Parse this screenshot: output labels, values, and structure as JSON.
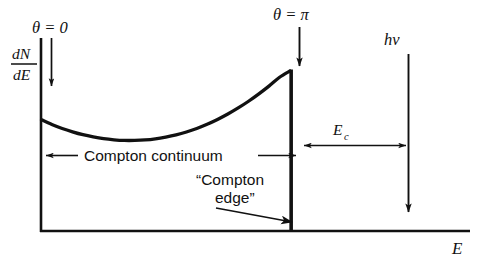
{
  "figure": {
    "kind": "compton-scattering-energy-spectrum",
    "axis": {
      "x_label": "E",
      "y_label_numerator": "dN",
      "y_label_denominator": "dE",
      "y_label_full": "dN/dE"
    },
    "annotations": {
      "theta_zero": "θ = 0",
      "theta_pi": "θ = π",
      "photon_energy": "hν",
      "compton_edge_energy": "E",
      "compton_edge_energy_subscript": "c",
      "continuum_label": "Compton continuum",
      "edge_label_line1": "“Compton",
      "edge_label_line2": "edge”"
    },
    "colors": {
      "ink": "#111111",
      "background": "#ffffff"
    }
  },
  "chart_data": {
    "type": "line",
    "title": "",
    "xlabel": "E",
    "ylabel": "dN/dE",
    "xlim": [
      0,
      1
    ],
    "ylim": [
      0,
      1
    ],
    "grid": false,
    "legend": "none",
    "series": [
      {
        "name": "Compton continuum",
        "x": [
          0.0,
          0.04,
          0.08,
          0.12,
          0.16,
          0.2,
          0.24,
          0.28,
          0.32,
          0.36,
          0.4,
          0.44,
          0.48,
          0.52,
          0.56,
          0.6,
          0.64,
          0.68,
          0.72,
          0.76,
          0.8,
          0.84,
          0.88,
          0.92,
          0.96,
          1.0
        ],
        "y": [
          0.695,
          0.666,
          0.641,
          0.62,
          0.602,
          0.588,
          0.577,
          0.57,
          0.566,
          0.566,
          0.569,
          0.576,
          0.587,
          0.601,
          0.619,
          0.641,
          0.667,
          0.697,
          0.731,
          0.769,
          0.811,
          0.857,
          0.907,
          0.961,
          1.0,
          1.0
        ]
      }
    ],
    "annotations": [
      {
        "name": "theta-zero",
        "label": "θ = 0",
        "points_to": "spectrum start at E = 0"
      },
      {
        "name": "theta-pi",
        "label": "θ = π",
        "points_to": "Compton edge maximum"
      },
      {
        "name": "compton-continuum-span",
        "label": "Compton continuum",
        "from": "E = 0",
        "to": "Compton edge"
      },
      {
        "name": "compton-edge-callout",
        "label": "“Compton edge”",
        "points_to": "sharp cutoff at Compton edge"
      },
      {
        "name": "ec-span",
        "label": "E_c",
        "from": "Compton edge",
        "to": "hν"
      },
      {
        "name": "photon-energy-marker",
        "label": "hν",
        "points_to": "full incident photon energy on E axis"
      }
    ]
  }
}
